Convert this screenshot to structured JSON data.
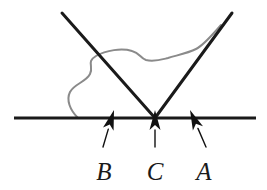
{
  "figure": {
    "background_color": "#ffffff",
    "width": 267,
    "height": 190
  },
  "colors": {
    "ray_stroke": "#1a1a1a",
    "surface_stroke": "#1a1a1a",
    "arrow_fill": "#111111",
    "wave_stroke": "#8a8a8a",
    "label_fill": "#1a1a1a"
  },
  "surface": {
    "name": "horizontal-surface-line",
    "x1": 14,
    "y1": 118,
    "x2": 256,
    "y2": 118,
    "stroke_width": 3
  },
  "rays": {
    "vertex_x": 155,
    "vertex_y": 118,
    "incident": {
      "name": "incident-ray",
      "x1": 62,
      "y1": 13,
      "x2": 155,
      "y2": 118,
      "stroke_width": 3
    },
    "reflected": {
      "name": "reflected-ray",
      "x1": 155,
      "y1": 118,
      "x2": 232,
      "y2": 13,
      "stroke_width": 3
    }
  },
  "wave": {
    "name": "wavefront-curve",
    "stroke_width": 2,
    "path": "M 78 118 C 70 110 66 100 70 92 C 74 84 86 82 90 74 C 94 66 86 62 96 56 C 106 50 122 48 132 51 C 140 53 140 58 146 60 C 154 62 160 60 168 58 C 178 55 188 53 196 49 C 204 45 212 35 221 25"
  },
  "markers": [
    {
      "id": "marker-b",
      "label": "B",
      "arrow_tip_x": 114,
      "arrow_tip_y": 110,
      "arrow_tail_x": 103,
      "arrow_tail_y": 147,
      "label_x": 104,
      "label_y": 180,
      "orientation": "slanted-up-right"
    },
    {
      "id": "marker-c",
      "label": "C",
      "arrow_tip_x": 155,
      "arrow_tip_y": 110,
      "arrow_tail_x": 155,
      "arrow_tail_y": 147,
      "label_x": 155,
      "label_y": 180,
      "orientation": "vertical-up"
    },
    {
      "id": "marker-a",
      "label": "A",
      "arrow_tip_x": 190,
      "arrow_tip_y": 110,
      "arrow_tail_x": 206,
      "arrow_tail_y": 147,
      "label_x": 204,
      "label_y": 180,
      "orientation": "slanted-up-left"
    }
  ]
}
